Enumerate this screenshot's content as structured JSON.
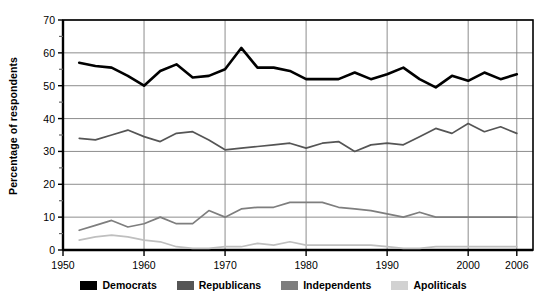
{
  "chart_data": {
    "type": "line",
    "title": "",
    "xlabel": "",
    "ylabel": "Percentage of respondents",
    "xlim": [
      1950,
      2008
    ],
    "ylim": [
      0,
      70
    ],
    "yticks": [
      0,
      10,
      20,
      30,
      40,
      50,
      60,
      70
    ],
    "ytick_labels": [
      "0",
      "10",
      "20",
      "30",
      "40",
      "50",
      "60",
      "70"
    ],
    "yminor_ticks": [
      5,
      15,
      25,
      35,
      45,
      55,
      65
    ],
    "xticks": [
      1950,
      1960,
      1970,
      1980,
      1990,
      2000,
      2006
    ],
    "xtick_labels": [
      "1950",
      "1960",
      "1970",
      "1980",
      "1990",
      "2000",
      "2006"
    ],
    "grid": "both",
    "legend_position": "bottom",
    "x": [
      1952,
      1954,
      1956,
      1958,
      1960,
      1962,
      1964,
      1966,
      1968,
      1970,
      1972,
      1974,
      1976,
      1978,
      1980,
      1982,
      1984,
      1986,
      1988,
      1990,
      1992,
      1994,
      1996,
      1998,
      2000,
      2002,
      2004,
      2006
    ],
    "series": [
      {
        "name": "Democrats",
        "color": "#000000",
        "width": 2.6,
        "values": [
          57.0,
          56.0,
          55.5,
          53.0,
          50.0,
          54.5,
          56.5,
          52.5,
          53.0,
          55.0,
          61.5,
          55.5,
          55.5,
          54.5,
          52.0,
          52.0,
          52.0,
          54.0,
          52.0,
          53.5,
          55.5,
          52.0,
          49.5,
          53.0,
          51.5,
          54.0,
          52.0,
          53.5
        ]
      },
      {
        "name": "Republicans",
        "color": "#555555",
        "width": 1.7,
        "values": [
          34.0,
          33.5,
          35.0,
          36.5,
          34.5,
          33.0,
          35.5,
          36.0,
          33.5,
          30.5,
          31.0,
          31.5,
          32.0,
          32.5,
          31.0,
          32.5,
          33.0,
          30.0,
          32.0,
          32.5,
          32.0,
          34.5,
          37.0,
          35.5,
          38.5,
          36.0,
          37.5,
          35.5
        ]
      },
      {
        "name": "Independents",
        "color": "#7e7e7e",
        "width": 1.7,
        "values": [
          6.0,
          7.5,
          9.0,
          7.0,
          8.0,
          10.0,
          8.0,
          8.0,
          12.0,
          10.0,
          12.5,
          13.0,
          13.0,
          14.5,
          14.5,
          14.5,
          13.0,
          12.5,
          12.0,
          11.0,
          10.0,
          11.5,
          10.0,
          10.0,
          10.0,
          10.0,
          10.0,
          10.0
        ]
      },
      {
        "name": "Apoliticals",
        "color": "#bfbfbf",
        "width": 1.7,
        "values": [
          3.0,
          4.0,
          4.5,
          4.0,
          3.0,
          2.5,
          1.0,
          0.5,
          0.5,
          1.0,
          1.0,
          2.0,
          1.5,
          2.5,
          1.5,
          1.5,
          1.5,
          1.5,
          1.5,
          1.0,
          0.5,
          0.5,
          1.0,
          1.0,
          1.0,
          1.0,
          1.0,
          1.0
        ]
      }
    ]
  },
  "legend": {
    "items": [
      {
        "label": "Democrats",
        "color": "#000000"
      },
      {
        "label": "Republicans",
        "color": "#555555"
      },
      {
        "label": "Independents",
        "color": "#7e7e7e"
      },
      {
        "label": "Apoliticals",
        "color": "#d2d2d2"
      }
    ]
  },
  "axes": {
    "frame_color": "#000000",
    "gridline_color": "#808080"
  }
}
